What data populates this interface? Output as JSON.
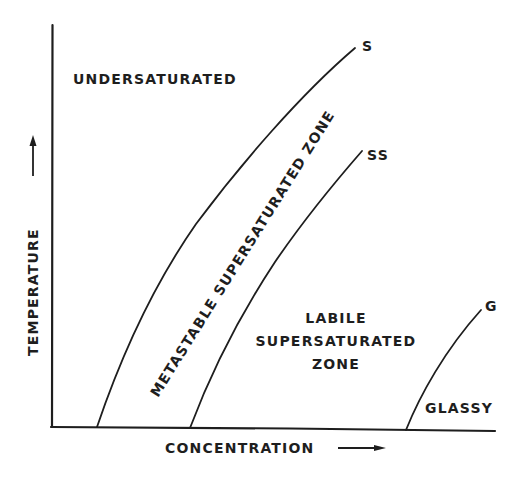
{
  "diagram": {
    "type": "phase-diagram",
    "x_axis_label": "CONCENTRATION",
    "y_axis_label": "TEMPERATURE",
    "curves": [
      {
        "id": "S",
        "label": "S",
        "meaning": "solubility curve"
      },
      {
        "id": "SS",
        "label": "SS",
        "meaning": "supersolubility curve"
      },
      {
        "id": "G",
        "label": "G",
        "meaning": "glass boundary"
      }
    ],
    "regions": {
      "undersaturated": "UNDERSATURATED",
      "metastable": "METASTABLE SUPERSATURATED ZONE",
      "labile_line1": "LABILE",
      "labile_line2": "SUPERSATURATED",
      "labile_line3": "ZONE",
      "glassy": "GLASSY"
    },
    "colors": {
      "ink": "#1e1e1e",
      "background": "#ffffff"
    }
  }
}
